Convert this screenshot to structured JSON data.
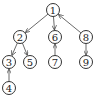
{
  "diagram": {
    "type": "directed-graph",
    "node_radius": 6.5,
    "colors": {
      "stroke": "#333333",
      "text": "#222222",
      "background": "#ffffff"
    },
    "nodes": [
      {
        "id": "1",
        "label": "1",
        "x": 53,
        "y": 10
      },
      {
        "id": "2",
        "label": "2",
        "x": 20,
        "y": 37
      },
      {
        "id": "6",
        "label": "6",
        "x": 55,
        "y": 37
      },
      {
        "id": "8",
        "label": "8",
        "x": 86,
        "y": 37
      },
      {
        "id": "3",
        "label": "3",
        "x": 9,
        "y": 62
      },
      {
        "id": "5",
        "label": "5",
        "x": 30,
        "y": 62
      },
      {
        "id": "7",
        "label": "7",
        "x": 55,
        "y": 62
      },
      {
        "id": "9",
        "label": "9",
        "x": 86,
        "y": 62
      },
      {
        "id": "4",
        "label": "4",
        "x": 9,
        "y": 88
      }
    ],
    "edges": [
      {
        "from": "1",
        "to": "2"
      },
      {
        "from": "1",
        "to": "6"
      },
      {
        "from": "8",
        "to": "1"
      },
      {
        "from": "2",
        "to": "3"
      },
      {
        "from": "2",
        "to": "5"
      },
      {
        "from": "4",
        "to": "3"
      },
      {
        "from": "7",
        "to": "6"
      },
      {
        "from": "8",
        "to": "9"
      }
    ]
  }
}
